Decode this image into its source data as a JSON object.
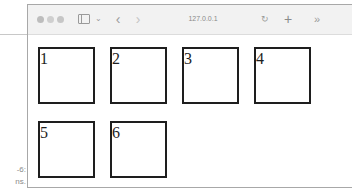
{
  "caption": {
    "line1": "-6:",
    "line2": "ns."
  },
  "browser": {
    "traffic_lights": [
      "close",
      "minimize",
      "zoom"
    ],
    "toolbar": {
      "sidebar_icon": "sidebar-icon",
      "sidebar_menu_icon": "⌄",
      "back_icon": "‹",
      "forward_icon": "›",
      "url": "127.0.0.1",
      "reload_icon": "↻",
      "new_tab_icon": "+",
      "overflow_icon": "»"
    }
  },
  "content": {
    "boxes": [
      {
        "label": "1"
      },
      {
        "label": "2"
      },
      {
        "label": "3"
      },
      {
        "label": "4"
      },
      {
        "label": "5"
      },
      {
        "label": "6"
      }
    ]
  },
  "colors": {
    "box_border": "#1e1e1e",
    "window_border": "#a8a8a8",
    "toolbar_bg": "#f2f2f2"
  }
}
